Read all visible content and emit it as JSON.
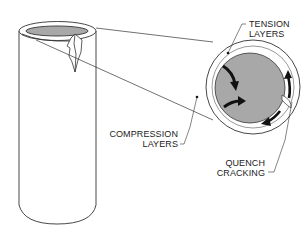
{
  "diagram": {
    "labels": {
      "tension": [
        "TENSION",
        "LAYERS"
      ],
      "compression": [
        "COMPRESSION",
        "LAYERS"
      ],
      "quench": [
        "QUENCH",
        "CRACKING"
      ]
    },
    "colors": {
      "line": "#333333",
      "core_fill": "#a8a8a8",
      "arrow": "#111111",
      "background": "#ffffff"
    }
  }
}
